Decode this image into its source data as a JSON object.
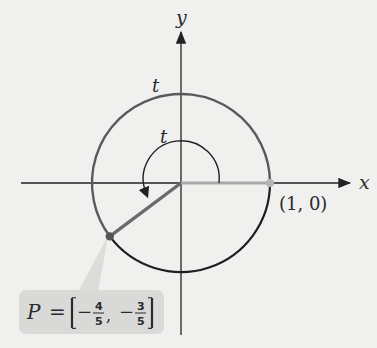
{
  "diagram": {
    "type": "unit-circle",
    "axes": {
      "x_label": "x",
      "y_label": "y"
    },
    "arc_label": "t",
    "angle_label": "t",
    "start_point": {
      "label": "(1, 0)",
      "x": 1,
      "y": 0
    },
    "point_P": {
      "name": "P",
      "equals": "=",
      "x_sign": "−",
      "x_num": "4",
      "x_den": "5",
      "y_sign": "−",
      "y_num": "3",
      "y_den": "5",
      "x": -0.8,
      "y": -0.6
    },
    "colors": {
      "background": "#f0f0ef",
      "arc_t": "#5a5a5a",
      "arc_rest": "#1e1e1e",
      "radius_to_P": "#6b6b6b",
      "radius_to_start": "#a9a9a9",
      "callout_bg": "#d9d9d8"
    }
  }
}
